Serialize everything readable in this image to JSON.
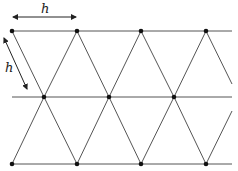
{
  "diagram": {
    "colors": {
      "line": "#555555",
      "point": "#111111",
      "arrow": "#222222"
    },
    "labels": {
      "horizontal_spacing": "h",
      "slanted_spacing": "h"
    },
    "rows": [
      {
        "name": "top",
        "y": 31,
        "x_start": 12,
        "x_end": 232,
        "points": [
          12,
          77,
          141,
          206
        ]
      },
      {
        "name": "middle",
        "y": 97,
        "x_start": 12,
        "x_end": 232,
        "points": [
          44,
          109,
          174
        ]
      },
      {
        "name": "bottom",
        "y": 164,
        "x_start": 12,
        "x_end": 232,
        "points": [
          12,
          77,
          141,
          206
        ]
      }
    ]
  }
}
